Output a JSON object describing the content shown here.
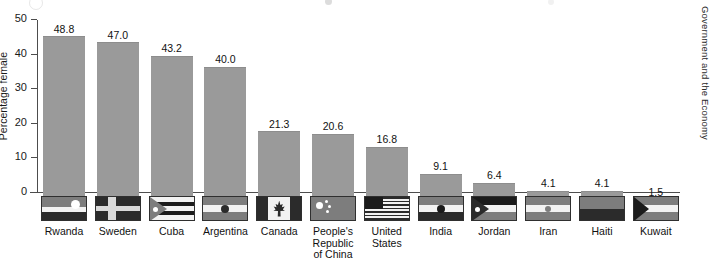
{
  "running_head": "Government and the Economy",
  "chart_data": {
    "type": "bar",
    "title": "",
    "xlabel": "",
    "ylabel": "Percentage female",
    "ylim": [
      0,
      50
    ],
    "yticks": [
      0,
      10,
      20,
      30,
      40,
      50
    ],
    "ytick_labels": [
      "0",
      "10",
      "20",
      "30",
      "40",
      "50"
    ],
    "grid": false,
    "legend": "none",
    "value_label_format": "one-decimal",
    "categories": [
      "Rwanda",
      "Sweden",
      "Cuba",
      "Argentina",
      "Canada",
      "People's Republic of China",
      "United States",
      "India",
      "Jordan",
      "Iran",
      "Haiti",
      "Kuwait"
    ],
    "category_labels": [
      [
        "Rwanda"
      ],
      [
        "Sweden"
      ],
      [
        "Cuba"
      ],
      [
        "Argentina"
      ],
      [
        "Canada"
      ],
      [
        "People's",
        "Republic",
        "of China"
      ],
      [
        "United",
        "States"
      ],
      [
        "India"
      ],
      [
        "Jordan"
      ],
      [
        "Iran"
      ],
      [
        "Haiti"
      ],
      [
        "Kuwait"
      ]
    ],
    "values": [
      48.8,
      47.0,
      43.2,
      40.0,
      21.3,
      20.6,
      16.8,
      9.1,
      6.4,
      4.1,
      4.1,
      1.5
    ],
    "value_labels": [
      "48.8",
      "47.0",
      "43.2",
      "40.0",
      "21.3",
      "20.6",
      "16.8",
      "9.1",
      "6.4",
      "4.1",
      "4.1",
      "1.5"
    ],
    "flags": [
      "rwanda-flag",
      "sweden-flag",
      "cuba-flag",
      "argentina-flag",
      "canada-flag",
      "china-flag",
      "united-states-flag",
      "india-flag",
      "jordan-flag",
      "iran-flag",
      "haiti-flag",
      "kuwait-flag"
    ]
  },
  "colors": {
    "bar_fill": "#9a9a9a",
    "axis": "#4d4d4d",
    "text": "#111111",
    "background": "#ffffff"
  }
}
